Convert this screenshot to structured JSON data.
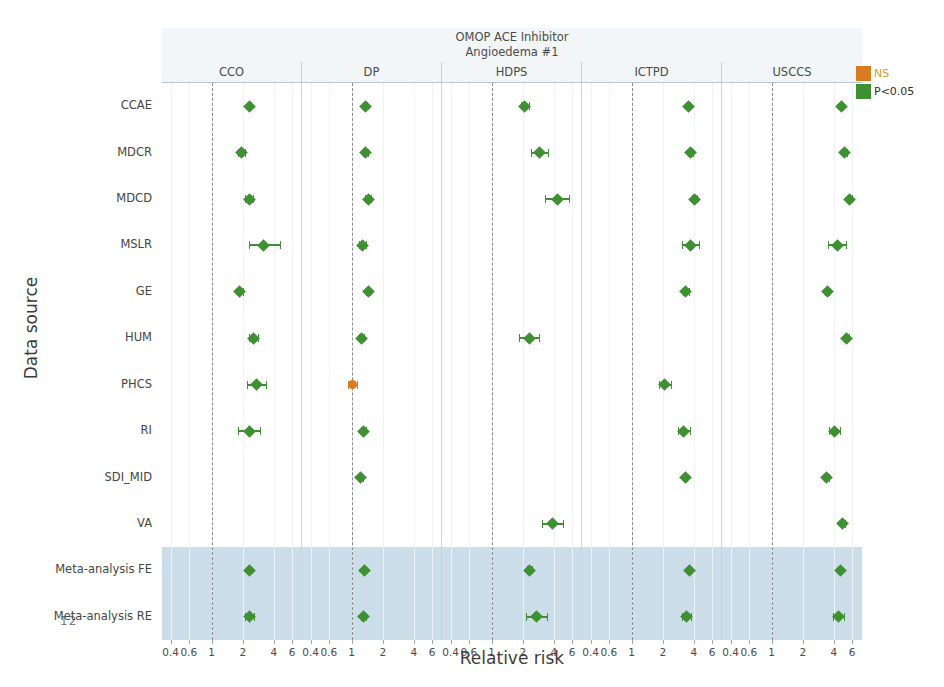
{
  "page_number": "12",
  "axes": {
    "y_title": "Data source",
    "x_title": "Relative risk",
    "x_ticks": [
      "0.4",
      "0.6",
      "1",
      "2",
      "4",
      "6"
    ],
    "x_tick_values": [
      0.4,
      0.6,
      1,
      2,
      4,
      6
    ],
    "x_scale": "log",
    "x_min": 0.33,
    "x_max": 7.5,
    "reference_value": 1
  },
  "title": {
    "line1": "OMOP ACE Inhibitor",
    "line2": "Angioedema #1"
  },
  "legend": {
    "position": "top-right",
    "items": [
      {
        "label": "NS",
        "color": "#d97b20"
      },
      {
        "label": "P<0.05",
        "color": "#3f8f33"
      }
    ]
  },
  "highlight": {
    "rows": [
      "Meta-analysis FE",
      "Meta-analysis RE"
    ],
    "color": "#c3d7e6"
  },
  "chart_data": {
    "type": "scatter",
    "xlabel": "Relative risk",
    "ylabel": "Data source",
    "xscale": "log",
    "xlim": [
      0.33,
      7.5
    ],
    "xticks": [
      0.4,
      0.6,
      1,
      2,
      4,
      6
    ],
    "grid": true,
    "legend": [
      "NS",
      "P<0.05"
    ],
    "facets": [
      "CCO",
      "DP",
      "HDPS",
      "ICTPD",
      "USCCS"
    ],
    "rows": [
      "CCAE",
      "MDCR",
      "MDCD",
      "MSLR",
      "GE",
      "HUM",
      "PHCS",
      "RI",
      "SDI_MID",
      "VA",
      "Meta-analysis FE",
      "Meta-analysis RE"
    ],
    "series": [
      {
        "name": "CCO",
        "points": [
          {
            "row": "CCAE",
            "rr": 2.35,
            "lo": 2.28,
            "hi": 2.43,
            "sig": true
          },
          {
            "row": "MDCR",
            "rr": 1.95,
            "lo": 1.8,
            "hi": 2.12,
            "sig": true
          },
          {
            "row": "MDCD",
            "rr": 2.3,
            "lo": 2.1,
            "hi": 2.52,
            "sig": true
          },
          {
            "row": "MSLR",
            "rr": 3.2,
            "lo": 2.3,
            "hi": 4.55,
            "sig": true
          },
          {
            "row": "GE",
            "rr": 1.88,
            "lo": 1.78,
            "hi": 1.99,
            "sig": true
          },
          {
            "row": "HUM",
            "rr": 2.55,
            "lo": 2.32,
            "hi": 2.8,
            "sig": true
          },
          {
            "row": "PHCS",
            "rr": 2.7,
            "lo": 2.2,
            "hi": 3.35,
            "sig": true
          },
          {
            "row": "RI",
            "rr": 2.35,
            "lo": 1.8,
            "hi": 2.95,
            "sig": true
          },
          {
            "row": "Meta-analysis FE",
            "rr": 2.3,
            "lo": 2.24,
            "hi": 2.37,
            "sig": true
          },
          {
            "row": "Meta-analysis RE",
            "rr": 2.32,
            "lo": 2.12,
            "hi": 2.55,
            "sig": true
          }
        ]
      },
      {
        "name": "DP",
        "points": [
          {
            "row": "CCAE",
            "rr": 1.36,
            "lo": 1.32,
            "hi": 1.41,
            "sig": true
          },
          {
            "row": "MDCR",
            "rr": 1.36,
            "lo": 1.28,
            "hi": 1.45,
            "sig": true
          },
          {
            "row": "MDCD",
            "rr": 1.45,
            "lo": 1.36,
            "hi": 1.55,
            "sig": true
          },
          {
            "row": "MSLR",
            "rr": 1.28,
            "lo": 1.19,
            "hi": 1.38,
            "sig": true
          },
          {
            "row": "GE",
            "rr": 1.44,
            "lo": 1.37,
            "hi": 1.52,
            "sig": true
          },
          {
            "row": "HUM",
            "rr": 1.24,
            "lo": 1.18,
            "hi": 1.31,
            "sig": true
          },
          {
            "row": "PHCS",
            "rr": 1.02,
            "lo": 0.93,
            "hi": 1.12,
            "sig": false
          },
          {
            "row": "RI",
            "rr": 1.3,
            "lo": 1.22,
            "hi": 1.39,
            "sig": true
          },
          {
            "row": "SDI_MID",
            "rr": 1.22,
            "lo": 1.15,
            "hi": 1.3,
            "sig": true
          },
          {
            "row": "Meta-analysis FE",
            "rr": 1.32,
            "lo": 1.29,
            "hi": 1.35,
            "sig": true
          },
          {
            "row": "Meta-analysis RE",
            "rr": 1.3,
            "lo": 1.23,
            "hi": 1.38,
            "sig": true
          }
        ]
      },
      {
        "name": "HDPS",
        "points": [
          {
            "row": "CCAE",
            "rr": 2.1,
            "lo": 1.92,
            "hi": 2.3,
            "sig": true
          },
          {
            "row": "MDCR",
            "rr": 2.9,
            "lo": 2.38,
            "hi": 3.55,
            "sig": true
          },
          {
            "row": "MDCD",
            "rr": 4.3,
            "lo": 3.3,
            "hi": 5.6,
            "sig": true
          },
          {
            "row": "HUM",
            "rr": 2.3,
            "lo": 1.82,
            "hi": 2.9,
            "sig": true
          },
          {
            "row": "VA",
            "rr": 3.9,
            "lo": 3.1,
            "hi": 4.9,
            "sig": true
          },
          {
            "row": "Meta-analysis FE",
            "rr": 2.32,
            "lo": 2.2,
            "hi": 2.45,
            "sig": true
          },
          {
            "row": "Meta-analysis RE",
            "rr": 2.7,
            "lo": 2.15,
            "hi": 3.4,
            "sig": true
          }
        ]
      },
      {
        "name": "ICTPD",
        "points": [
          {
            "row": "CCAE",
            "rr": 3.55,
            "lo": 3.45,
            "hi": 3.65,
            "sig": true
          },
          {
            "row": "MDCR",
            "rr": 3.75,
            "lo": 3.55,
            "hi": 3.95,
            "sig": true
          },
          {
            "row": "MDCD",
            "rr": 4.05,
            "lo": 3.85,
            "hi": 4.25,
            "sig": true
          },
          {
            "row": "MSLR",
            "rr": 3.7,
            "lo": 3.05,
            "hi": 4.45,
            "sig": true
          },
          {
            "row": "GE",
            "rr": 3.35,
            "lo": 3.12,
            "hi": 3.6,
            "sig": true
          },
          {
            "row": "PHCS",
            "rr": 2.1,
            "lo": 1.85,
            "hi": 2.38,
            "sig": true
          },
          {
            "row": "RI",
            "rr": 3.2,
            "lo": 2.8,
            "hi": 3.65,
            "sig": true
          },
          {
            "row": "SDI_MID",
            "rr": 3.3,
            "lo": 3.18,
            "hi": 3.45,
            "sig": true
          },
          {
            "row": "Meta-analysis FE",
            "rr": 3.6,
            "lo": 3.52,
            "hi": 3.68,
            "sig": true
          },
          {
            "row": "Meta-analysis RE",
            "rr": 3.4,
            "lo": 3.1,
            "hi": 3.72,
            "sig": true
          }
        ]
      },
      {
        "name": "USCCS",
        "points": [
          {
            "row": "CCAE",
            "rr": 4.7,
            "lo": 4.58,
            "hi": 4.82,
            "sig": true
          },
          {
            "row": "MDCR",
            "rr": 5.1,
            "lo": 4.9,
            "hi": 5.32,
            "sig": true
          },
          {
            "row": "MDCD",
            "rr": 5.7,
            "lo": 5.45,
            "hi": 5.95,
            "sig": true
          },
          {
            "row": "MSLR",
            "rr": 4.3,
            "lo": 3.55,
            "hi": 5.2,
            "sig": true
          },
          {
            "row": "GE",
            "rr": 3.45,
            "lo": 3.3,
            "hi": 3.62,
            "sig": true
          },
          {
            "row": "HUM",
            "rr": 5.3,
            "lo": 5.05,
            "hi": 5.58,
            "sig": true
          },
          {
            "row": "RI",
            "rr": 4.05,
            "lo": 3.6,
            "hi": 4.55,
            "sig": true
          },
          {
            "row": "SDI_MID",
            "rr": 3.4,
            "lo": 3.22,
            "hi": 3.6,
            "sig": true
          },
          {
            "row": "VA",
            "rr": 4.9,
            "lo": 4.7,
            "hi": 5.12,
            "sig": true
          },
          {
            "row": "Meta-analysis FE",
            "rr": 4.6,
            "lo": 4.52,
            "hi": 4.7,
            "sig": true
          },
          {
            "row": "Meta-analysis RE",
            "rr": 4.45,
            "lo": 3.95,
            "hi": 5.0,
            "sig": true
          }
        ]
      }
    ]
  }
}
